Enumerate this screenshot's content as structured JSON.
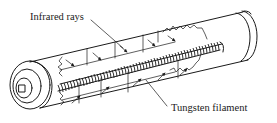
{
  "diagram": {
    "labels": {
      "infrared_rays": "Infrared rays",
      "tungsten_filament": "Tungsten filament"
    },
    "colors": {
      "line": "#1a1a1a",
      "background": "#ffffff"
    }
  }
}
